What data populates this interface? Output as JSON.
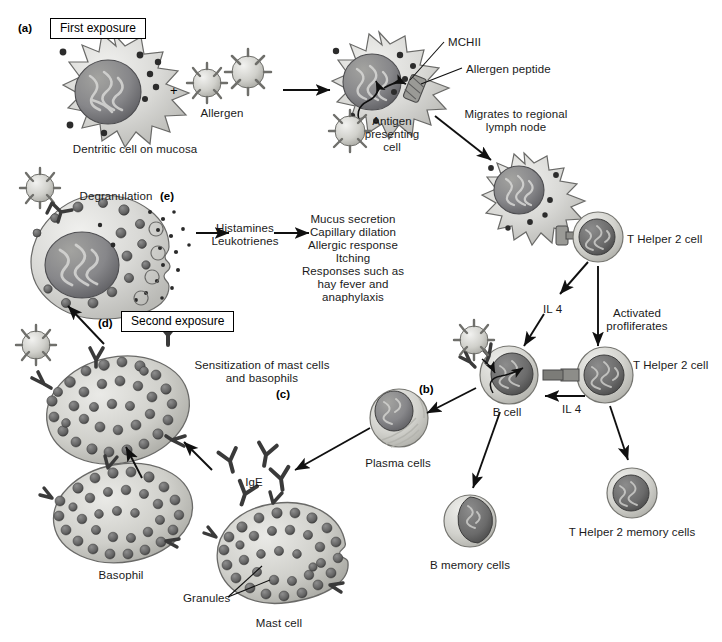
{
  "figure": {
    "background_color": "#ffffff",
    "ink_color": "#1a1a1a"
  },
  "panels": [
    {
      "tag": "(a)",
      "x": 18,
      "y": 22
    },
    {
      "tag": "(e)",
      "x": 160,
      "y": 190
    },
    {
      "tag": "(d)",
      "x": 98,
      "y": 317
    },
    {
      "tag": "(c)",
      "x": 276,
      "y": 388
    },
    {
      "tag": "(b)",
      "x": 419,
      "y": 383
    }
  ],
  "boxes": [
    {
      "name": "first-exposure-box",
      "text": "First exposure",
      "x": 50,
      "y": 20
    },
    {
      "name": "second-exposure-box",
      "text": "Second exposure",
      "x": 121,
      "y": 313
    }
  ],
  "operators": [
    {
      "name": "plus-sign",
      "text": "+",
      "x": 170,
      "y": 83
    }
  ],
  "labels": [
    {
      "name": "dendritic-cell-label",
      "text": "Dentritic cell on mucosa",
      "x": 135,
      "y": 143,
      "align": "c"
    },
    {
      "name": "allergen-label",
      "text": "Allergen",
      "x": 222,
      "y": 107,
      "align": "c"
    },
    {
      "name": "mchii-label",
      "text": "MCHII",
      "x": 448,
      "y": 36,
      "align": "l"
    },
    {
      "name": "allergen-peptide-label",
      "text": "Allergen peptide",
      "x": 466,
      "y": 63,
      "align": "l"
    },
    {
      "name": "antigen-presenting-cell-label",
      "text": "Antigen\npresenting\ncell",
      "x": 392,
      "y": 115,
      "align": "c"
    },
    {
      "name": "migrates-label",
      "text": "Migrates to regional\nlymph node",
      "x": 516,
      "y": 108,
      "align": "c"
    },
    {
      "name": "t-helper-2-cell-label-top",
      "text": "T Helper 2 cell",
      "x": 627,
      "y": 233,
      "align": "l"
    },
    {
      "name": "il4-label-upper",
      "text": "IL 4",
      "x": 543,
      "y": 303,
      "align": "l"
    },
    {
      "name": "activated-proliferates-label",
      "text": "Activated\nprofliferates",
      "x": 637,
      "y": 307,
      "align": "c"
    },
    {
      "name": "t-helper-2-cell-label-lower",
      "text": "T Helper 2 cell",
      "x": 633,
      "y": 359,
      "align": "l"
    },
    {
      "name": "il4-label-lower",
      "text": "IL 4",
      "x": 562,
      "y": 403,
      "align": "l"
    },
    {
      "name": "t-helper-2-memory-cells-label",
      "text": "T Helper 2 memory cells",
      "x": 632,
      "y": 526,
      "align": "c"
    },
    {
      "name": "b-cell-label",
      "text": "B cell",
      "x": 507,
      "y": 406,
      "align": "c"
    },
    {
      "name": "b-memory-cells-label",
      "text": "B memory cells",
      "x": 470,
      "y": 559,
      "align": "c"
    },
    {
      "name": "plasma-cells-label",
      "text": "Plasma cells",
      "x": 398,
      "y": 457,
      "align": "c"
    },
    {
      "name": "ige-label",
      "text": "IgE",
      "x": 254,
      "y": 476,
      "align": "c"
    },
    {
      "name": "sensitization-label",
      "text": "Sensitization of mast cells\nand basophils",
      "x": 262,
      "y": 359,
      "align": "c"
    },
    {
      "name": "basophil-label",
      "text": "Basophil",
      "x": 121,
      "y": 569,
      "align": "c"
    },
    {
      "name": "granules-label",
      "text": "Granules",
      "x": 183,
      "y": 598,
      "align": "l"
    },
    {
      "name": "mast-cell-label",
      "text": "Mast cell",
      "x": 279,
      "y": 624,
      "align": "c"
    },
    {
      "name": "degranulation-label",
      "text": "Degranulation",
      "x": 116,
      "y": 190,
      "align": "c"
    },
    {
      "name": "mediators-label",
      "text": "Histamines\nLeukotrienes",
      "x": 245,
      "y": 227,
      "align": "c"
    },
    {
      "name": "effects-label",
      "text": "Mucus secretion\nCapillary dilation\nAllergic response\nItching\nResponses such as\nhay fever and\nanaphylaxis",
      "x": 353,
      "y": 218,
      "align": "c"
    }
  ],
  "cells": [
    {
      "name": "dendritic-cell-mucosa",
      "type": "dendritic",
      "cx": 113,
      "cy": 93,
      "r": 60
    },
    {
      "name": "antigen-presenting-cell",
      "type": "dendritic",
      "cx": 379,
      "cy": 86,
      "r": 54
    },
    {
      "name": "lymph-node-dendritic-cell",
      "type": "dendritic",
      "cx": 524,
      "cy": 197,
      "r": 46
    },
    {
      "name": "t-helper-2-cell-top",
      "type": "lymphocyte",
      "cx": 598,
      "cy": 237,
      "r": 25
    },
    {
      "name": "t-helper-2-cell-lower",
      "type": "lymphocyte",
      "cx": 605,
      "cy": 375,
      "r": 28
    },
    {
      "name": "t-helper-2-memory-cell",
      "type": "lymphocyte",
      "cx": 632,
      "cy": 493,
      "r": 25
    },
    {
      "name": "b-cell",
      "type": "lymphocyte",
      "cx": 509,
      "cy": 375,
      "r": 29
    },
    {
      "name": "b-memory-cell",
      "type": "lymphocyte",
      "cx": 470,
      "cy": 521,
      "r": 26
    },
    {
      "name": "plasma-cell",
      "type": "plasma",
      "cx": 399,
      "cy": 418,
      "r": 29
    },
    {
      "name": "mast-cell-degranulating",
      "type": "granulated",
      "cx": 101,
      "cy": 252,
      "rx": 70,
      "ry": 57
    },
    {
      "name": "sensitized-mast-cell",
      "type": "granulated",
      "cx": 118,
      "cy": 410,
      "rx": 70,
      "ry": 52
    },
    {
      "name": "basophil",
      "type": "granulated",
      "cx": 123,
      "cy": 513,
      "rx": 68,
      "ry": 48
    },
    {
      "name": "mast-cell",
      "type": "granulated",
      "cx": 281,
      "cy": 553,
      "rx": 63,
      "ry": 50
    }
  ],
  "allergens": [
    {
      "name": "allergen-particle-1",
      "cx": 207,
      "cy": 83,
      "r": 18
    },
    {
      "name": "allergen-particle-2",
      "cx": 248,
      "cy": 72,
      "r": 21
    },
    {
      "name": "allergen-particle-3",
      "cx": 350,
      "cy": 131,
      "r": 20
    },
    {
      "name": "allergen-particle-4",
      "cx": 40,
      "cy": 188,
      "r": 19
    },
    {
      "name": "allergen-particle-5",
      "cx": 36,
      "cy": 345,
      "r": 19
    },
    {
      "name": "allergen-particle-6",
      "cx": 474,
      "cy": 340,
      "r": 19
    }
  ],
  "ige_antibodies": [
    {
      "name": "ige-antibody-1",
      "cx": 230,
      "cy": 461
    },
    {
      "name": "ige-antibody-2",
      "cx": 266,
      "cy": 455
    },
    {
      "name": "ige-antibody-3",
      "cx": 281,
      "cy": 479
    },
    {
      "name": "ige-antibody-4",
      "cx": 245,
      "cy": 494
    }
  ],
  "arrows": [
    {
      "name": "arrow-allergen-to-apc",
      "from": [
        283,
        90
      ],
      "to": [
        332,
        90
      ]
    },
    {
      "name": "arrow-apc-to-lymph-node",
      "from": [
        435,
        116
      ],
      "to": [
        493,
        161
      ]
    },
    {
      "name": "arrow-th2-to-il4",
      "from": [
        588,
        262
      ],
      "to": [
        558,
        296
      ]
    },
    {
      "name": "arrow-th2-proliferates",
      "from": [
        598,
        266
      ],
      "to": [
        598,
        348
      ]
    },
    {
      "name": "arrow-il4-to-bcell",
      "from": [
        546,
        311
      ],
      "to": [
        524,
        347
      ]
    },
    {
      "name": "arrow-th2-to-memory",
      "from": [
        612,
        404
      ],
      "to": [
        627,
        462
      ]
    },
    {
      "name": "arrow-th2-il4-to-bcell",
      "from": [
        583,
        396
      ],
      "to": [
        543,
        396
      ]
    },
    {
      "name": "arrow-bcell-to-plasma",
      "from": [
        474,
        390
      ],
      "to": [
        425,
        414
      ]
    },
    {
      "name": "arrow-bcell-to-bmemory",
      "from": [
        500,
        410
      ],
      "to": [
        473,
        490
      ]
    },
    {
      "name": "arrow-plasma-to-ige",
      "from": [
        370,
        428
      ],
      "to": [
        293,
        470
      ]
    },
    {
      "name": "arrow-ige-to-mastcell",
      "from": [
        212,
        470
      ],
      "to": [
        182,
        440
      ]
    },
    {
      "name": "arrow-basophil-up",
      "from": [
        140,
        475
      ],
      "to": [
        124,
        445
      ]
    },
    {
      "name": "arrow-second-exposure-up",
      "from": [
        103,
        342
      ],
      "to": [
        66,
        305
      ]
    },
    {
      "name": "arrow-degran-to-mediators",
      "from": [
        195,
        233
      ],
      "to": [
        228,
        233
      ]
    },
    {
      "name": "arrow-mediators-to-effects",
      "from": [
        273,
        233
      ],
      "to": [
        308,
        233
      ]
    },
    {
      "name": "leader-mchii",
      "from": [
        444,
        42
      ],
      "to": [
        404,
        82
      ]
    },
    {
      "name": "leader-allergen-peptide",
      "from": [
        462,
        68
      ],
      "to": [
        415,
        85
      ]
    },
    {
      "name": "leader-granules",
      "from": [
        228,
        597
      ],
      "to": [
        262,
        568
      ]
    }
  ]
}
